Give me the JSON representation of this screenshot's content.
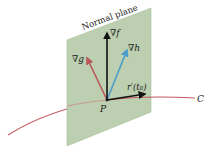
{
  "figure": {
    "plane_label": "Normal plane",
    "point_label": "P",
    "curve_label": "C",
    "vectors": [
      {
        "id": "grad-f",
        "label": "∇f",
        "color": "#111111"
      },
      {
        "id": "grad-g",
        "label": "∇g",
        "color": "#b8585a"
      },
      {
        "id": "grad-h",
        "label": "∇h",
        "color": "#4a9ccc"
      },
      {
        "id": "tangent",
        "label": "r′(t₀)",
        "color": "#111111"
      }
    ],
    "colors": {
      "plane_fill": "#bccfb0",
      "plane_edge": "#a9bf9c",
      "curve": "#c65a62"
    }
  }
}
